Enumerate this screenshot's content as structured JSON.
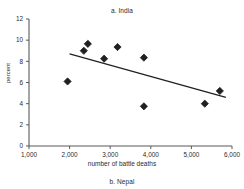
{
  "figure": {
    "panel_label": "a. India",
    "next_panel_label": "b. Nepal"
  },
  "chart_data": {
    "type": "scatter",
    "title": "a. India",
    "xlabel": "number of battle deaths",
    "ylabel": "percent",
    "xlim": [
      1000,
      6000
    ],
    "ylim": [
      0,
      12
    ],
    "xticks": [
      1000,
      2000,
      3000,
      4000,
      5000,
      6000
    ],
    "xticklabels": [
      "1,000",
      "2,000",
      "3,000",
      "4,000",
      "5,000",
      "6,000"
    ],
    "yticks": [
      0,
      2,
      4,
      6,
      8,
      10,
      12
    ],
    "yticklabels": [
      "0",
      "2",
      "4",
      "6",
      "8",
      "10",
      "12"
    ],
    "grid": false,
    "legend": false,
    "marker": "diamond",
    "marker_color": "#231f20",
    "points": [
      {
        "x": 1950,
        "y": 6.1
      },
      {
        "x": 2350,
        "y": 9.0
      },
      {
        "x": 2450,
        "y": 9.65
      },
      {
        "x": 2850,
        "y": 8.25
      },
      {
        "x": 3180,
        "y": 9.35
      },
      {
        "x": 3830,
        "y": 8.35
      },
      {
        "x": 3830,
        "y": 3.75
      },
      {
        "x": 5330,
        "y": 4.0
      },
      {
        "x": 5700,
        "y": 5.2
      }
    ],
    "trendline": {
      "type": "linear-fit",
      "x_start": 2000,
      "y_start": 8.7,
      "x_end": 5850,
      "y_end": 4.6,
      "color": "#231f20"
    }
  }
}
